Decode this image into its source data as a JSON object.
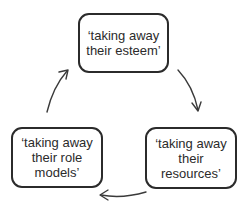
{
  "diagram": {
    "type": "cycle",
    "nodes": [
      {
        "id": "top",
        "label": "‘taking away\ntheir esteem’"
      },
      {
        "id": "right",
        "label": "‘taking away\ntheir\nresources’"
      },
      {
        "id": "left",
        "label": "‘taking away\ntheir role\nmodels’"
      }
    ],
    "edges": [
      {
        "from": "top",
        "to": "right"
      },
      {
        "from": "right",
        "to": "left"
      },
      {
        "from": "left",
        "to": "top"
      }
    ],
    "colors": {
      "stroke": "#2b2b2b",
      "text": "#2b2b2b",
      "background": "#ffffff"
    }
  }
}
